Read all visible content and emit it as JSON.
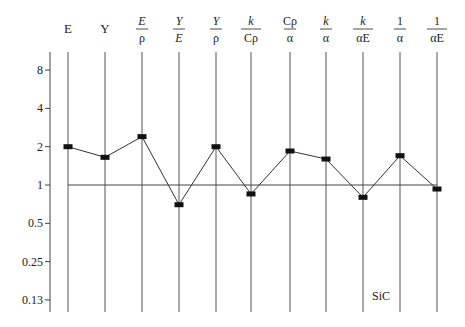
{
  "chart_data": {
    "type": "line",
    "title": "",
    "xlabel": "",
    "ylabel": "",
    "yscale": "log2",
    "ylim": [
      0.13,
      10
    ],
    "y_ticks": [
      "8",
      "4",
      "2",
      "1",
      "0.5",
      "0.25",
      "0.13"
    ],
    "reference_line": 1,
    "grid": "vertical lines at each category",
    "annotation": "SiC",
    "categories": [
      {
        "id": "E",
        "num": "E",
        "den": ""
      },
      {
        "id": "Y",
        "num": "Y",
        "den": ""
      },
      {
        "id": "E/rho",
        "num": "E",
        "den": "ρ"
      },
      {
        "id": "Y/E",
        "num": "Y",
        "den": "E"
      },
      {
        "id": "Y/rho",
        "num": "Y",
        "den": "ρ"
      },
      {
        "id": "k/Crho",
        "num": "k",
        "den": "Cρ"
      },
      {
        "id": "Crho/alpha",
        "num": "Cρ",
        "den": "α"
      },
      {
        "id": "k/alpha",
        "num": "k",
        "den": "α"
      },
      {
        "id": "k/alphaE",
        "num": "k",
        "den": "αE"
      },
      {
        "id": "1/alpha",
        "num": "1",
        "den": "α"
      },
      {
        "id": "1/alphaE",
        "num": "1",
        "den": "αE"
      }
    ],
    "series": [
      {
        "name": "SiC",
        "values": [
          2.0,
          1.65,
          2.4,
          0.7,
          2.0,
          0.85,
          1.85,
          1.6,
          0.8,
          1.7,
          0.93
        ]
      }
    ]
  }
}
